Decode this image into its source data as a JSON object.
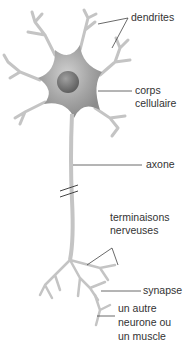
{
  "diagram": {
    "subject": "neurone",
    "colors": {
      "cell": "#a8a8a8",
      "cell_dark": "#8a8a8a",
      "nucleus": "#777777",
      "branch": "#c4c4c4",
      "leader": "#444444",
      "text": "#333333"
    },
    "labels": {
      "dendrites": "dendrites",
      "corps1": "corps",
      "corps2": "cellulaire",
      "axone": "axone",
      "term1": "terminaisons",
      "term2": "nerveuses",
      "synapse": "synapse",
      "autre1": "un autre",
      "autre2": "neurone ou",
      "autre3": "un muscle"
    }
  }
}
